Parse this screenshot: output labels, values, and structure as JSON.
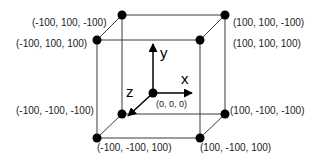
{
  "diagram": {
    "axes": [
      {
        "name": "x",
        "label": "x"
      },
      {
        "name": "y",
        "label": "y"
      },
      {
        "name": "z",
        "label": "z"
      }
    ],
    "origin_label": "(0, 0, 0)",
    "vertices": [
      {
        "id": "tbl",
        "label": "(-100, 100, -100)"
      },
      {
        "id": "tbr",
        "label": "(100, 100, -100)"
      },
      {
        "id": "tfl",
        "label": "(-100, 100, 100)"
      },
      {
        "id": "tfr",
        "label": "(100, 100, 100)"
      },
      {
        "id": "bbl",
        "label": "(-100, -100, -100)"
      },
      {
        "id": "bbr",
        "label": "(100, -100, -100)"
      },
      {
        "id": "bfl",
        "label": "(-100, -100, 100)"
      },
      {
        "id": "bfr",
        "label": "(100, -100, 100)"
      }
    ],
    "colors": {
      "line": "#3a3a3a",
      "vertex": "#000000",
      "text": "#222222"
    }
  }
}
